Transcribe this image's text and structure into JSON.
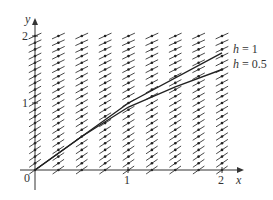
{
  "chart_data": {
    "type": "line",
    "title": "",
    "xlabel": "x",
    "ylabel": "y",
    "xlim": [
      0,
      2
    ],
    "ylim": [
      0,
      2
    ],
    "x_ticks": [
      "0",
      "1",
      "2"
    ],
    "y_ticks": [
      "1",
      "2"
    ],
    "grid": false,
    "legend_position": "inline-right",
    "direction_field": {
      "present": true,
      "x_spacing": 0.25,
      "y_spacing": 0.1,
      "description": "slope field short line segments with dot at center"
    },
    "series": [
      {
        "name": "h = 1",
        "x": [
          0,
          1,
          2
        ],
        "y": [
          0,
          1.0,
          1.75
        ]
      },
      {
        "name": "h = 0.5",
        "x": [
          0,
          0.5,
          1.0,
          1.5,
          2.0
        ],
        "y": [
          0,
          0.5,
          0.94,
          1.24,
          1.5
        ]
      }
    ],
    "annotations": [
      "h = 1",
      "h = 0.5"
    ]
  },
  "labels": {
    "x_axis": "x",
    "y_axis": "y",
    "origin": "0",
    "x_tick_1": "1",
    "x_tick_2": "2",
    "y_tick_1": "1",
    "y_tick_2": "2",
    "h1_prefix": "h",
    "h1_suffix": " = 1",
    "h05_prefix": "h",
    "h05_suffix": " = 0.5"
  },
  "colors": {
    "ink": "#222222",
    "background": "#ffffff"
  }
}
